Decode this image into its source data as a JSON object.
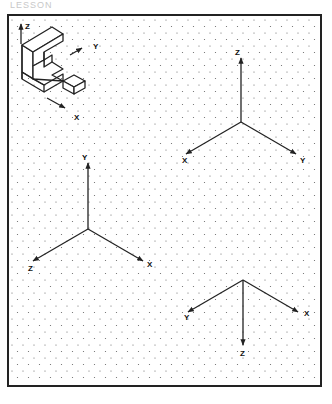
{
  "page": {
    "heading": "LESSON",
    "colors": {
      "line": "#222222",
      "dot": "#666666",
      "paper": "#ffffff"
    }
  },
  "grid": {
    "type": "isometric-dot-grid",
    "col_spacing": 11,
    "row_spacing": 13
  },
  "example_object": {
    "axis_labels": {
      "z": "Z",
      "y": "Y",
      "x": "X"
    }
  },
  "axis_sets": [
    {
      "name": "axis-set-1",
      "labels": {
        "up": "Z",
        "left": "X",
        "right": "Y"
      }
    },
    {
      "name": "axis-set-2",
      "labels": {
        "up": "Y",
        "left": "Z",
        "right": "X"
      }
    },
    {
      "name": "axis-set-3",
      "labels": {
        "down": "Z",
        "left": "Y",
        "right": "X"
      }
    }
  ]
}
